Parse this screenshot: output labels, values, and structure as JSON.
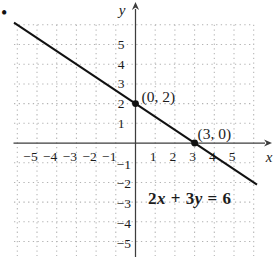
{
  "page": {
    "bullet": "•"
  },
  "chart_data": {
    "type": "line",
    "title": "",
    "xlabel": "x",
    "ylabel": "y",
    "xlim": [
      -6.2,
      6.3
    ],
    "ylim": [
      -5.9,
      6.2
    ],
    "grid": "dotted",
    "x_ticks": [
      {
        "v": -5,
        "label": "−5"
      },
      {
        "v": -4,
        "label": "−4"
      },
      {
        "v": -3,
        "label": "−3"
      },
      {
        "v": -2,
        "label": "−2"
      },
      {
        "v": -1,
        "label": "−1"
      },
      {
        "v": 1,
        "label": "1"
      },
      {
        "v": 2,
        "label": "2"
      },
      {
        "v": 3,
        "label": "3"
      },
      {
        "v": 4,
        "label": "4"
      },
      {
        "v": 5,
        "label": "5"
      }
    ],
    "y_ticks": [
      {
        "v": 5,
        "label": "5"
      },
      {
        "v": 4,
        "label": "4"
      },
      {
        "v": 3,
        "label": "3"
      },
      {
        "v": 2,
        "label": "2"
      },
      {
        "v": 1,
        "label": "1"
      },
      {
        "v": -1,
        "label": "−1"
      },
      {
        "v": -2,
        "label": "−2"
      },
      {
        "v": -3,
        "label": "−3"
      },
      {
        "v": -4,
        "label": "−4"
      },
      {
        "v": -5,
        "label": "−5"
      }
    ],
    "series": [
      {
        "name": "2x + 3y = 6",
        "slope": -0.6667,
        "y_intercept": 2,
        "x_intercept": 3,
        "points": [
          [
            0,
            2
          ],
          [
            3,
            0
          ]
        ]
      }
    ],
    "marked_points": [
      {
        "x": 0,
        "y": 2,
        "label": "(0, 2)"
      },
      {
        "x": 3,
        "y": 0,
        "label": "(3, 0)"
      }
    ],
    "equation": "2x + 3y = 6",
    "equation_parts": [
      {
        "text": "2",
        "italic": false
      },
      {
        "text": "x",
        "italic": true
      },
      {
        "text": " + 3",
        "italic": false
      },
      {
        "text": "y",
        "italic": true
      },
      {
        "text": " = 6",
        "italic": false
      }
    ],
    "colors": {
      "line": "#111111",
      "axes": "#3d3d3d",
      "grid": "#b3b3b3",
      "text": "#1c1c1c"
    }
  }
}
